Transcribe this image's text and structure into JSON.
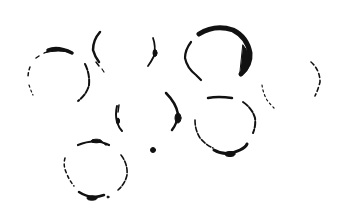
{
  "image": {
    "description": "Stained rings on white paper",
    "background": "#ffffff",
    "ink": "#111111"
  },
  "rings": [
    {
      "id": "ring-top-left",
      "cx": 55,
      "cy": 76,
      "r": 28
    },
    {
      "id": "ring-top-center",
      "cx": 122,
      "cy": 58,
      "r": 30
    },
    {
      "id": "ring-top-right-bold",
      "cx": 216,
      "cy": 54,
      "r": 30
    },
    {
      "id": "ring-far-right-faint",
      "cx": 292,
      "cy": 86,
      "r": 26
    },
    {
      "id": "ring-middle",
      "cx": 148,
      "cy": 112,
      "r": 30
    },
    {
      "id": "ring-center-right",
      "cx": 222,
      "cy": 126,
      "r": 30
    },
    {
      "id": "ring-bottom-left",
      "cx": 96,
      "cy": 168,
      "r": 32
    }
  ],
  "dot": {
    "cx": 153,
    "cy": 150,
    "r": 2.5
  }
}
